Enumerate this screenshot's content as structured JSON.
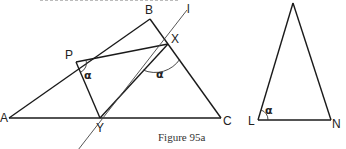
{
  "figure": {
    "caption": "Figure 95a",
    "colors": {
      "stroke": "#1a1a1a",
      "background": "#ffffff"
    },
    "left_triangle": {
      "vertices": {
        "A": {
          "label": "A",
          "x": 9,
          "y": 118
        },
        "B": {
          "label": "B",
          "x": 150,
          "y": 19
        },
        "C": {
          "label": "C",
          "x": 221,
          "y": 118
        }
      },
      "inner_points": {
        "P": {
          "label": "P",
          "x": 76,
          "y": 62
        },
        "X": {
          "label": "X",
          "x": 168,
          "y": 44
        },
        "Y": {
          "label": "Y",
          "x": 100,
          "y": 118
        }
      },
      "line_l": {
        "label": "l",
        "x1": 78,
        "y1": 150,
        "x2": 187,
        "y2": 10
      },
      "angle_at_P": "α",
      "angle_at_X": "α"
    },
    "right_triangle": {
      "vertices": {
        "M": {
          "label": "",
          "x": 293,
          "y": 3
        },
        "L": {
          "label": "L",
          "x": 258,
          "y": 120
        },
        "N": {
          "label": "N",
          "x": 331,
          "y": 120
        }
      },
      "angle_at_L": "α"
    },
    "top_cutoff_text": "(…) …"
  }
}
